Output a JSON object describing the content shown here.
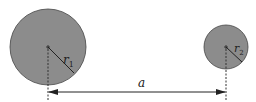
{
  "diagram": {
    "circle1": {
      "cx": 48,
      "cy": 47,
      "r": 38,
      "label": "r",
      "sub": "1"
    },
    "circle2": {
      "cx": 226,
      "cy": 47,
      "r": 22,
      "label": "r",
      "sub": "2"
    },
    "distance": {
      "label": "a",
      "y": 92
    },
    "colors": {
      "fill": "#8c8c8c",
      "stroke": "#333333",
      "line": "#222222"
    }
  }
}
